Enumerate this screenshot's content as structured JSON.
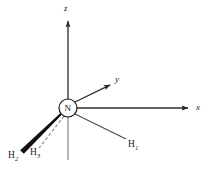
{
  "figure": {
    "background_color": "#ffffff",
    "line_color": "#1a1a1a",
    "axis_color": "#2b2b2b",
    "z_negative_color": "#8c8c8c"
  },
  "center_atom": {
    "label": "N",
    "cx": 68,
    "cy": 108,
    "r": 9
  },
  "axes": [
    {
      "name": "x-axis",
      "label": "x",
      "label_x": 196,
      "label_y": 104,
      "from": [
        77,
        108
      ],
      "to": [
        190,
        108
      ],
      "arrow": true
    },
    {
      "name": "y-axis",
      "label": "y",
      "label_x": 115,
      "label_y": 76,
      "from": [
        75,
        102
      ],
      "to": [
        112,
        84
      ],
      "arrow": true
    },
    {
      "name": "z-axis",
      "label": "z",
      "label_x": 65,
      "label_y": 4,
      "from": [
        68,
        99
      ],
      "to": [
        68,
        19
      ],
      "arrow": true
    },
    {
      "name": "z-negative-axis",
      "label": "",
      "label_x": 0,
      "label_y": 0,
      "from": [
        68,
        117
      ],
      "to": [
        68,
        160
      ],
      "arrow": false
    }
  ],
  "bonds": [
    {
      "name": "bond-h1",
      "style": "plain",
      "from": [
        75,
        114
      ],
      "to": [
        126,
        139
      ]
    },
    {
      "name": "bond-h2",
      "style": "wedge",
      "from": [
        61,
        114
      ],
      "to": [
        22,
        152
      ]
    },
    {
      "name": "bond-h3",
      "style": "hashed",
      "from": [
        64,
        116
      ],
      "to": [
        39,
        148
      ]
    }
  ],
  "hydrogens": [
    {
      "name": "h1",
      "label": "H",
      "sub": "1",
      "x": 128,
      "y": 140
    },
    {
      "name": "h2",
      "label": "H",
      "sub": "2",
      "x": 8,
      "y": 151
    },
    {
      "name": "h3",
      "label": "H",
      "sub": "3",
      "x": 30,
      "y": 148
    }
  ]
}
